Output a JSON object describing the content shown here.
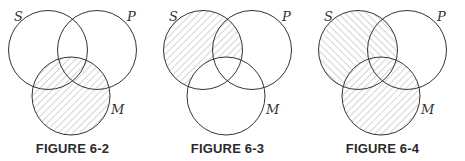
{
  "figures": [
    {
      "caption": "FIGURE 6-2",
      "labels": {
        "s": "S",
        "p": "P",
        "m": "M"
      },
      "shaded": "All of M hatched"
    },
    {
      "caption": "FIGURE 6-3",
      "labels": {
        "s": "S",
        "p": "P",
        "m": "M"
      },
      "shaded": "S outside M hatched"
    },
    {
      "caption": "FIGURE 6-4",
      "labels": {
        "s": "S",
        "p": "P",
        "m": "M"
      },
      "shaded": "S outside M hatched backslash; all of M hatched forward slash"
    }
  ],
  "colors": {
    "stroke": "#333333",
    "hatch": "#9a9a9a",
    "background": "#ffffff"
  }
}
